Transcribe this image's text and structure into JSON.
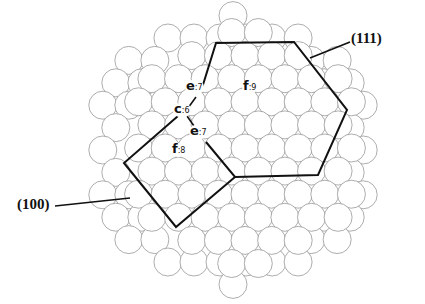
{
  "figure": {
    "type": "cluster-diagram",
    "facets": [
      {
        "id": "111",
        "label": "(111)",
        "shape": "hexagon"
      },
      {
        "id": "100",
        "label": "(100)",
        "shape": "square"
      }
    ],
    "atoms": [
      {
        "site": "e",
        "coordination": "7",
        "sep": ":",
        "label": "e:7"
      },
      {
        "site": "f",
        "coordination": "9",
        "sep": ":",
        "label": "f:9"
      },
      {
        "site": "c",
        "coordination": "6",
        "sep": ":",
        "label": "c:6"
      },
      {
        "site": "e",
        "coordination": "7",
        "sep": ":",
        "label": "e:7"
      },
      {
        "site": "f",
        "coordination": "8",
        "sep": ":",
        "label": "f:8"
      }
    ],
    "colors": {
      "outline": "#111111",
      "sphere_stroke": "#8a8a8a",
      "background": "#ffffff"
    }
  }
}
